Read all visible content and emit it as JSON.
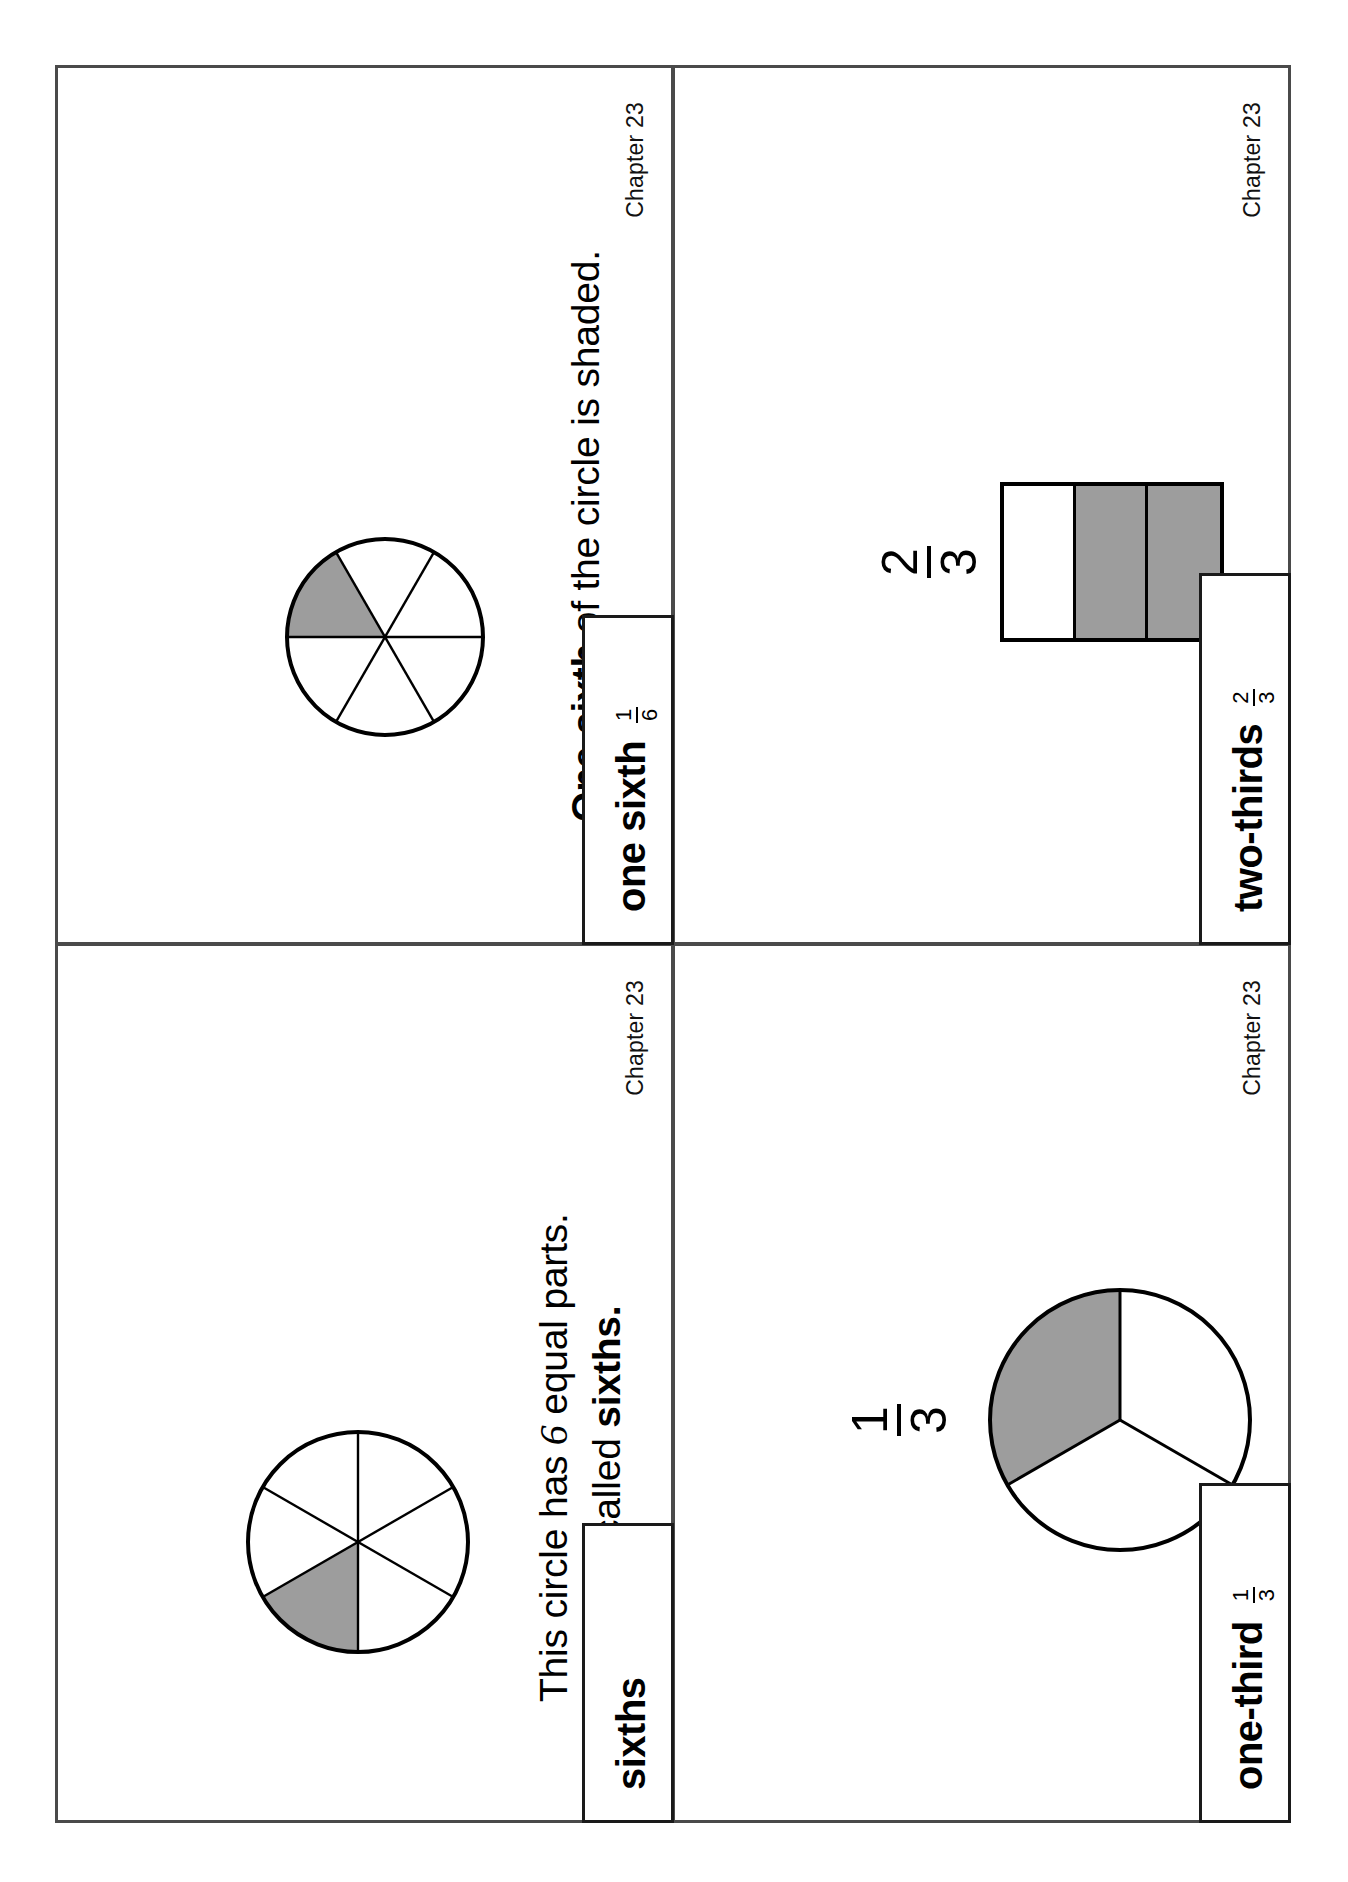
{
  "document": {
    "kind": "math-flash-cards",
    "shaded_color": "#9d9d9d",
    "line_color": "#000000",
    "card_border_color": "#4a4a4a"
  },
  "cards": [
    {
      "id": "sixths",
      "term": "sixths",
      "fraction": null,
      "chapter": "Chapter 23",
      "body_lines": [
        {
          "pre": "This circle has ",
          "emph": "6",
          "post": " equal parts."
        },
        {
          "pre": "They are called ",
          "bold": "sixths.",
          "post": ""
        }
      ],
      "figure": {
        "type": "pie",
        "parts": 6,
        "shaded_parts": 1,
        "shaded_index": 2,
        "label": null
      }
    },
    {
      "id": "one-sixth",
      "term": "one sixth",
      "fraction": {
        "numerator": "1",
        "denominator": "6"
      },
      "chapter": "Chapter 23",
      "body_lines": [
        {
          "bold": "One-sixth",
          "post": " of the circle is shaded."
        }
      ],
      "figure": {
        "type": "pie",
        "parts": 6,
        "shaded_parts": 1,
        "shaded_index": 0,
        "label": null
      }
    },
    {
      "id": "one-third",
      "term": "one-third",
      "fraction": {
        "numerator": "1",
        "denominator": "3"
      },
      "chapter": "Chapter 23",
      "body_lines": [],
      "figure": {
        "type": "pie",
        "parts": 3,
        "shaded_parts": 1,
        "shaded_index": 0,
        "label": {
          "numerator": "1",
          "denominator": "3"
        }
      }
    },
    {
      "id": "two-thirds",
      "term": "two-thirds",
      "fraction": {
        "numerator": "2",
        "denominator": "3"
      },
      "chapter": "Chapter 23",
      "body_lines": [],
      "figure": {
        "type": "bar",
        "parts": 3,
        "shaded_parts": 2,
        "cells": [
          "white",
          "shaded",
          "shaded"
        ],
        "label": {
          "numerator": "2",
          "denominator": "3"
        }
      }
    }
  ]
}
